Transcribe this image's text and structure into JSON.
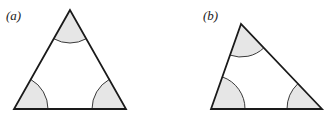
{
  "figure": {
    "panels": [
      {
        "id": "a",
        "label": "(a)",
        "label_pos": [
          6,
          20
        ],
        "vertices": {
          "apex": [
            70,
            10
          ],
          "bottom_left": [
            14,
            109
          ],
          "bottom_right": [
            126,
            109
          ]
        },
        "angle_arcs": [
          {
            "vertex": "apex",
            "start": [
              53.7,
              38.7
            ],
            "end": [
              86.3,
              38.7
            ],
            "radius": 33
          },
          {
            "vertex": "bottom_left",
            "start": [
              30.7,
              79.4
            ],
            "end": [
              48,
              109
            ],
            "radius": 34
          },
          {
            "vertex": "bottom_right",
            "start": [
              92,
              109
            ],
            "end": [
              109.3,
              79.4
            ],
            "radius": 34
          }
        ]
      },
      {
        "id": "b",
        "label": "(b)",
        "label_pos": [
          203,
          20
        ],
        "vertices": {
          "apex": [
            241,
            24
          ],
          "bottom_left": [
            211,
            109
          ],
          "bottom_right": [
            322,
            109
          ]
        },
        "angle_arcs": [
          {
            "vertex": "apex",
            "start": [
              230,
              55.1
            ],
            "end": [
              263.8,
              47.9
            ],
            "radius": 33
          },
          {
            "vertex": "bottom_left",
            "start": [
              222.3,
              76.9
            ],
            "end": [
              245,
              109
            ],
            "radius": 34
          },
          {
            "vertex": "bottom_right",
            "start": [
              287,
              109
            ],
            "end": [
              297.9,
              83.7
            ],
            "radius": 35
          }
        ]
      }
    ],
    "colors": {
      "stroke": "#1a1a1a",
      "arc_stroke": "#3a3a3a",
      "arc_fill": "#e6e6e6",
      "background": "#ffffff"
    }
  }
}
